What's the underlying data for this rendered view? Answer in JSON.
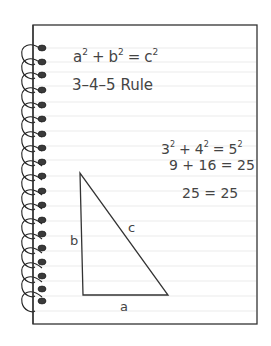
{
  "notebook": {
    "colors": {
      "paper": "#ffffff",
      "border": "#333333",
      "rule_line": "#e4e4e4",
      "ink": "#444444",
      "coil": "#222222",
      "hole": "#3a3a3a"
    },
    "lines": {
      "equation": "a² + b² = c²",
      "rule_name": "3–4–5 Rule",
      "step1": "3² + 4² = 5²",
      "step2": "9 + 16 = 25",
      "step3": "25 = 25"
    },
    "equation_parts": {
      "a": "a",
      "a_exp": "2",
      "plus": "+",
      "b": "b",
      "b_exp": "2",
      "eq": "=",
      "c": "c",
      "c_exp": "2"
    },
    "step1_parts": {
      "three": "3",
      "three_exp": "2",
      "plus": "+",
      "four": "4",
      "four_exp": "2",
      "eq": "=",
      "five": "5",
      "five_exp": "2"
    },
    "triangle": {
      "label_a": "a",
      "label_b": "b",
      "label_c": "c"
    },
    "coil_count": 21
  }
}
